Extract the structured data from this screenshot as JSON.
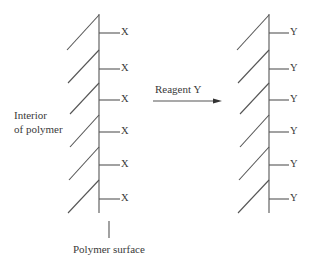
{
  "diagram": {
    "left_structure": {
      "substituent_label": "X",
      "branch_count": 6
    },
    "right_structure": {
      "substituent_label": "Y",
      "branch_count": 6
    },
    "arrow": {
      "label": "Reagent Y"
    },
    "labels": {
      "interior_line1": "Interior",
      "interior_line2": "of polymer",
      "surface": "Polymer surface"
    },
    "colors": {
      "line": "#555555",
      "text": "#3a3a3a"
    }
  }
}
